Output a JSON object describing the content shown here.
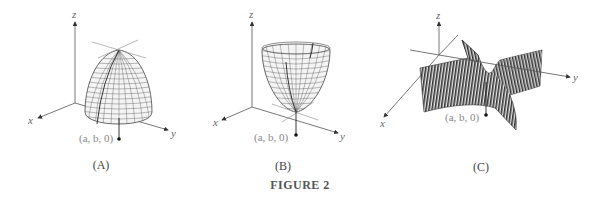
{
  "figure": {
    "caption": "FIGURE 2",
    "panels": [
      {
        "id": "A",
        "caption": "(A)",
        "surface": "downward-opening paraboloid (local maximum)",
        "axes": {
          "x": "x",
          "y": "y",
          "z": "z"
        },
        "point_label": "(a, b, 0)"
      },
      {
        "id": "B",
        "caption": "(B)",
        "surface": "upward-opening paraboloid (local minimum)",
        "axes": {
          "x": "x",
          "y": "y",
          "z": "z"
        },
        "point_label": "(a, b, 0)"
      },
      {
        "id": "C",
        "caption": "(C)",
        "surface": "saddle surface (saddle point)",
        "axes": {
          "x": "x",
          "y": "y",
          "z": "z"
        },
        "point_label": "(a, b, 0)"
      }
    ]
  },
  "colors": {
    "axis": "#555555",
    "mesh": "#444444",
    "surface_fill": "#f2f2f2",
    "tangent_line": "#999999",
    "label": "#777777"
  }
}
